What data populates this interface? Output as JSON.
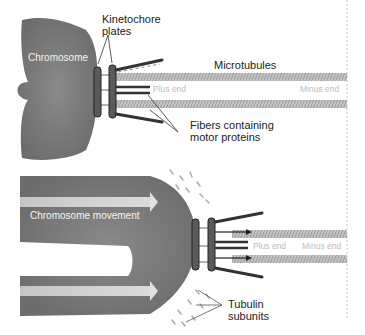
{
  "panels": [
    {
      "id": "top",
      "labels": {
        "chromosome": "Chromosome",
        "kinetochore": "Kinetochore\nplates",
        "microtubules": "Microtubules",
        "plus_end": "Plus end",
        "minus_end": "Minus end",
        "fibers": "Fibers containing\nmotor proteins"
      }
    },
    {
      "id": "bottom",
      "labels": {
        "movement": "Chromosome movement",
        "plus_end": "Plus end",
        "minus_end": "Minus end",
        "tubulin": "Tubulin\nsubunits"
      }
    }
  ],
  "colors": {
    "chromosome": "#7a7a7a",
    "microtubule": "#b4b4b4",
    "plate": "#555555",
    "text": "#222222",
    "faint_text": "#bdbdbd"
  }
}
